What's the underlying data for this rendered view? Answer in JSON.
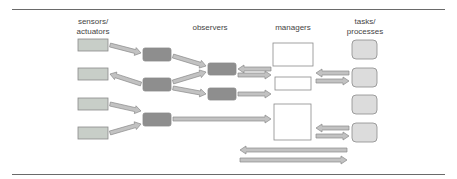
{
  "columns": {
    "sensors": "sensors/\nactuators",
    "observers": "observers",
    "managers": "managers",
    "tasks": "tasks/\nprocesses"
  },
  "colors": {
    "sensor_fill": "#c8cec8",
    "observer_fill": "#8e8e8e",
    "manager_fill": "#ffffff",
    "task_fill": "#dcdcdc",
    "arrow_fill": "#c2c2c2",
    "stroke": "#8a8a8a",
    "rule": "#6a6a6a"
  },
  "nodes": {
    "sensors": [
      {
        "x": 78,
        "y": 39,
        "w": 30,
        "h": 12
      },
      {
        "x": 78,
        "y": 68,
        "w": 30,
        "h": 12
      },
      {
        "x": 78,
        "y": 98,
        "w": 30,
        "h": 12
      },
      {
        "x": 78,
        "y": 127,
        "w": 30,
        "h": 12
      }
    ],
    "observers_level1": [
      {
        "x": 143,
        "y": 48,
        "w": 28,
        "h": 13
      },
      {
        "x": 143,
        "y": 78,
        "w": 28,
        "h": 13
      },
      {
        "x": 143,
        "y": 113,
        "w": 28,
        "h": 13
      }
    ],
    "observers_level2": [
      {
        "x": 208,
        "y": 63,
        "w": 28,
        "h": 12
      },
      {
        "x": 208,
        "y": 88,
        "w": 28,
        "h": 12
      }
    ],
    "managers": [
      {
        "x": 273,
        "y": 43,
        "w": 40,
        "h": 23
      },
      {
        "x": 275,
        "y": 77,
        "w": 36,
        "h": 13
      },
      {
        "x": 274,
        "y": 104,
        "w": 37,
        "h": 36
      }
    ],
    "tasks": [
      {
        "x": 352,
        "y": 40,
        "w": 25,
        "h": 19
      },
      {
        "x": 352,
        "y": 68,
        "w": 25,
        "h": 19
      },
      {
        "x": 352,
        "y": 95,
        "w": 25,
        "h": 19
      },
      {
        "x": 352,
        "y": 123,
        "w": 25,
        "h": 19
      }
    ]
  },
  "arrows": [
    {
      "from": [
        110,
        45
      ],
      "to": [
        141,
        53
      ]
    },
    {
      "from": [
        141,
        84
      ],
      "to": [
        110,
        74
      ]
    },
    {
      "from": [
        110,
        104
      ],
      "to": [
        141,
        111
      ]
    },
    {
      "from": [
        110,
        133
      ],
      "to": [
        141,
        124
      ]
    },
    {
      "from": [
        173,
        56
      ],
      "to": [
        206,
        66
      ]
    },
    {
      "from": [
        173,
        82
      ],
      "to": [
        206,
        72
      ]
    },
    {
      "from": [
        173,
        88
      ],
      "to": [
        206,
        94
      ]
    },
    {
      "from": [
        271,
        69
      ],
      "to": [
        238,
        69
      ]
    },
    {
      "from": [
        238,
        75
      ],
      "to": [
        271,
        75
      ]
    },
    {
      "from": [
        238,
        94
      ],
      "to": [
        271,
        94
      ]
    },
    {
      "from": [
        173,
        119
      ],
      "to": [
        271,
        119
      ]
    },
    {
      "from": [
        349,
        73
      ],
      "to": [
        316,
        73
      ]
    },
    {
      "from": [
        316,
        81
      ],
      "to": [
        349,
        81
      ]
    },
    {
      "from": [
        349,
        128
      ],
      "to": [
        316,
        128
      ]
    },
    {
      "from": [
        316,
        136
      ],
      "to": [
        349,
        136
      ]
    },
    {
      "from": [
        347,
        150
      ],
      "to": [
        240,
        150
      ]
    },
    {
      "from": [
        240,
        160
      ],
      "to": [
        347,
        160
      ]
    }
  ]
}
